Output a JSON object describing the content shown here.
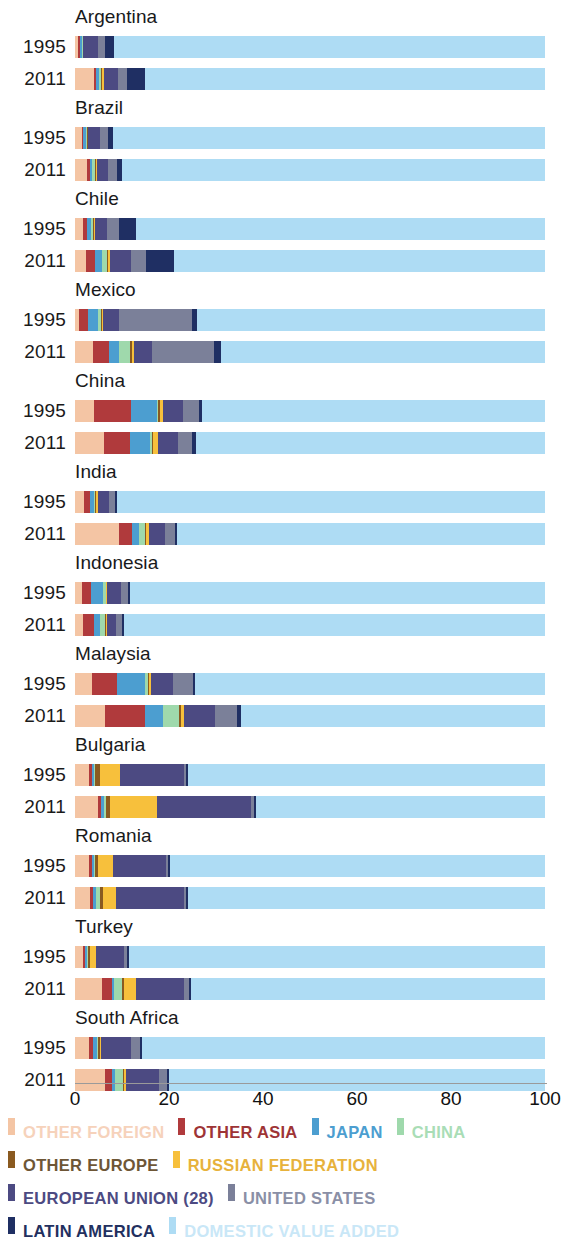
{
  "axis": {
    "ticks": [
      "0",
      "20",
      "40",
      "60",
      "80",
      "100"
    ],
    "min": 0,
    "max": 100
  },
  "legend": {
    "rows": [
      [
        {
          "label": "OTHER FOREIGN",
          "color": "#f4c5a4"
        },
        {
          "label": "OTHER ASIA",
          "color": "#b03a3c"
        },
        {
          "label": "JAPAN",
          "color": "#4c9ed0"
        },
        {
          "label": "CHINA",
          "color": "#9fd9ac"
        }
      ],
      [
        {
          "label": "OTHER EUROPE",
          "color": "#8a5a20"
        },
        {
          "label": "RUSSIAN FEDERATION",
          "color": "#f7c03c"
        }
      ],
      [
        {
          "label": "EUROPEAN UNION (28)",
          "color": "#4c4a82"
        },
        {
          "label": "UNITED STATES",
          "color": "#7b8099"
        }
      ],
      [
        {
          "label": "LATIN AMERICA",
          "color": "#1f2f63"
        },
        {
          "label": "DOMESTIC VALUE ADDED",
          "color": "#aedcf4"
        }
      ]
    ]
  },
  "chart_data": {
    "type": "bar",
    "orientation": "horizontal",
    "stacked": true,
    "title": "",
    "xlabel": "",
    "ylabel": "",
    "xlim": [
      0,
      100
    ],
    "grid": false,
    "legend_position": "bottom",
    "series": [
      {
        "name": "OTHER FOREIGN",
        "color": "#f4c5a4"
      },
      {
        "name": "OTHER ASIA",
        "color": "#b03a3c"
      },
      {
        "name": "JAPAN",
        "color": "#4c9ed0"
      },
      {
        "name": "CHINA",
        "color": "#9fd9ac"
      },
      {
        "name": "OTHER EUROPE",
        "color": "#8a5a20"
      },
      {
        "name": "RUSSIAN FEDERATION",
        "color": "#f7c03c"
      },
      {
        "name": "EUROPEAN UNION (28)",
        "color": "#4c4a82"
      },
      {
        "name": "UNITED STATES",
        "color": "#7b8099"
      },
      {
        "name": "LATIN AMERICA",
        "color": "#1f2f63"
      },
      {
        "name": "DOMESTIC VALUE ADDED",
        "color": "#aedcf4"
      }
    ],
    "groups": [
      {
        "country": "Argentina",
        "bars": [
          {
            "year": "1995",
            "values": [
              0.6,
              0.4,
              0.4,
              0.2,
              0.1,
              0.1,
              3.2,
              1.4,
              1.8,
              91.8
            ]
          },
          {
            "year": "2011",
            "values": [
              4.0,
              0.5,
              0.6,
              0.5,
              0.2,
              0.3,
              3.0,
              2.0,
              3.9,
              85.0
            ]
          }
        ]
      },
      {
        "country": "Brazil",
        "bars": [
          {
            "year": "1995",
            "values": [
              1.4,
              0.4,
              0.6,
              0.2,
              0.1,
              0.1,
              2.6,
              1.6,
              1.0,
              92.0
            ]
          },
          {
            "year": "2011",
            "values": [
              2.6,
              0.6,
              0.5,
              0.6,
              0.2,
              0.2,
              2.4,
              1.9,
              1.0,
              90.0
            ]
          }
        ]
      },
      {
        "country": "Chile",
        "bars": [
          {
            "year": "1995",
            "values": [
              1.6,
              1.0,
              0.9,
              0.4,
              0.2,
              0.2,
              2.6,
              2.4,
              3.7,
              87.0
            ]
          },
          {
            "year": "2011",
            "values": [
              2.4,
              1.8,
              1.6,
              1.0,
              0.3,
              0.4,
              4.4,
              3.2,
              5.9,
              79.0
            ]
          }
        ]
      },
      {
        "country": "Mexico",
        "bars": [
          {
            "year": "1995",
            "values": [
              0.8,
              2.0,
              2.2,
              0.5,
              0.2,
              0.3,
              3.4,
              15.6,
              1.0,
              74.0
            ]
          },
          {
            "year": "2011",
            "values": [
              3.8,
              3.4,
              2.2,
              2.4,
              0.3,
              0.4,
              3.8,
              13.2,
              1.5,
              69.0
            ]
          }
        ]
      },
      {
        "country": "China",
        "bars": [
          {
            "year": "1995",
            "values": [
              4.0,
              8.0,
              5.4,
              0.3,
              0.4,
              0.6,
              4.2,
              3.4,
              0.7,
              73.0
            ]
          },
          {
            "year": "2011",
            "values": [
              6.2,
              5.6,
              4.2,
              0.3,
              0.4,
              1.0,
              4.2,
              3.0,
              0.9,
              74.2
            ]
          }
        ]
      },
      {
        "country": "India",
        "bars": [
          {
            "year": "1995",
            "values": [
              2.0,
              1.2,
              0.8,
              0.2,
              0.2,
              0.5,
              2.4,
              1.2,
              0.4,
              91.1
            ]
          },
          {
            "year": "2011",
            "values": [
              9.4,
              2.8,
              1.4,
              1.2,
              0.3,
              0.7,
              3.4,
              2.0,
              0.6,
              78.2
            ]
          }
        ]
      },
      {
        "country": "Indonesia",
        "bars": [
          {
            "year": "1995",
            "values": [
              1.4,
              2.0,
              2.6,
              0.5,
              0.2,
              0.2,
              2.8,
              1.6,
              0.5,
              88.2
            ]
          },
          {
            "year": "2011",
            "values": [
              1.6,
              2.4,
              1.4,
              1.0,
              0.2,
              0.2,
              2.0,
              1.2,
              0.4,
              89.6
            ]
          }
        ]
      },
      {
        "country": "Malaysia",
        "bars": [
          {
            "year": "1995",
            "values": [
              3.6,
              5.4,
              6.0,
              0.6,
              0.2,
              0.3,
              4.8,
              4.2,
              0.5,
              74.4
            ]
          },
          {
            "year": "2011",
            "values": [
              6.4,
              8.4,
              4.0,
              3.4,
              0.3,
              0.8,
              6.6,
              4.6,
              0.8,
              64.7
            ]
          }
        ]
      },
      {
        "country": "Bulgaria",
        "bars": [
          {
            "year": "1995",
            "values": [
              3.0,
              0.7,
              0.4,
              0.2,
              1.0,
              4.2,
              13.6,
              0.6,
              0.3,
              76.0
            ]
          },
          {
            "year": "2011",
            "values": [
              4.8,
              0.8,
              0.5,
              0.5,
              0.8,
              10.0,
              20.0,
              0.7,
              0.4,
              61.5
            ]
          }
        ]
      },
      {
        "country": "Romania",
        "bars": [
          {
            "year": "1995",
            "values": [
              3.0,
              0.6,
              0.4,
              0.2,
              0.8,
              3.0,
              11.4,
              0.5,
              0.3,
              79.8
            ]
          },
          {
            "year": "2011",
            "values": [
              3.2,
              0.7,
              0.5,
              0.9,
              0.6,
              2.8,
              14.4,
              0.6,
              0.4,
              75.9
            ]
          }
        ]
      },
      {
        "country": "Turkey",
        "bars": [
          {
            "year": "1995",
            "values": [
              1.6,
              0.5,
              0.4,
              0.2,
              0.4,
              1.4,
              6.0,
              0.6,
              0.3,
              88.6
            ]
          },
          {
            "year": "2011",
            "values": [
              5.8,
              2.0,
              0.5,
              1.8,
              0.4,
              2.4,
              10.2,
              1.2,
              0.4,
              75.3
            ]
          }
        ]
      },
      {
        "country": "South Africa",
        "bars": [
          {
            "year": "1995",
            "values": [
              3.0,
              0.8,
              0.8,
              0.4,
              0.3,
              0.3,
              6.4,
              1.8,
              0.4,
              85.8
            ]
          },
          {
            "year": "2011",
            "values": [
              6.4,
              1.4,
              0.8,
              1.6,
              0.3,
              0.4,
              7.0,
              1.6,
              0.5,
              80.0
            ]
          }
        ]
      }
    ]
  }
}
